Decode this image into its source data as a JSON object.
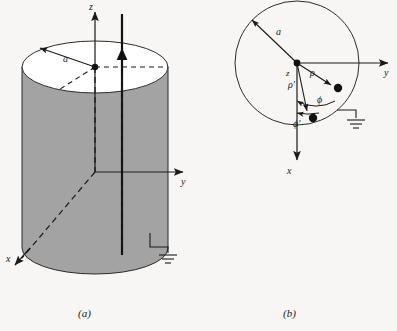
{
  "figure": {
    "background_color": "#f7f6f4",
    "ink_color": "#1a1a1a",
    "cylinder_fill": "#a3a3a3",
    "cylinder_top_fill": "#ffffff",
    "panels": [
      {
        "id": "a",
        "caption": "(a)",
        "description": "Grounded conducting cylinder of radius a with an axial current filament parallel to the z axis",
        "axes": [
          {
            "name": "z",
            "label": "z",
            "direction": "up"
          },
          {
            "name": "y",
            "label": "y",
            "direction": "right"
          },
          {
            "name": "x",
            "label": "x",
            "direction": "down-left"
          }
        ],
        "radius_label": "a",
        "filament_label": "",
        "ground_symbol": "earth-ground"
      },
      {
        "id": "b",
        "caption": "(b)",
        "description": "Cross-sectional view in the x-y plane showing field point and source point in polar coordinates",
        "axes": [
          {
            "name": "y",
            "label": "y",
            "direction": "right"
          },
          {
            "name": "x",
            "label": "x",
            "direction": "down"
          },
          {
            "name": "z",
            "label": "z",
            "direction": "out-of-page"
          }
        ],
        "radius_label": "a",
        "coordinate_labels": [
          {
            "name": "rho",
            "label": "ρ"
          },
          {
            "name": "rho-prime",
            "label": "ρ′"
          },
          {
            "name": "phi",
            "label": "ϕ"
          },
          {
            "name": "phi-prime",
            "label": "ϕ′"
          }
        ],
        "points": [
          {
            "name": "field-point",
            "label": ""
          },
          {
            "name": "source-point",
            "label": ""
          }
        ],
        "ground_symbol": "earth-ground"
      }
    ]
  }
}
